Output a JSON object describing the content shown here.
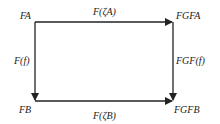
{
  "diagram": {
    "type": "commutative-square",
    "nodes": {
      "top_left": "FA",
      "top_right": "FGFA",
      "bottom_left": "FB",
      "bottom_right": "FGFB"
    },
    "arrows": {
      "top": "F(ζA)",
      "bottom": "F(ζB)",
      "left": "F(f)",
      "right": "FGF(f)"
    },
    "colors": {
      "line": "#222222",
      "background": "#ffffff"
    }
  }
}
